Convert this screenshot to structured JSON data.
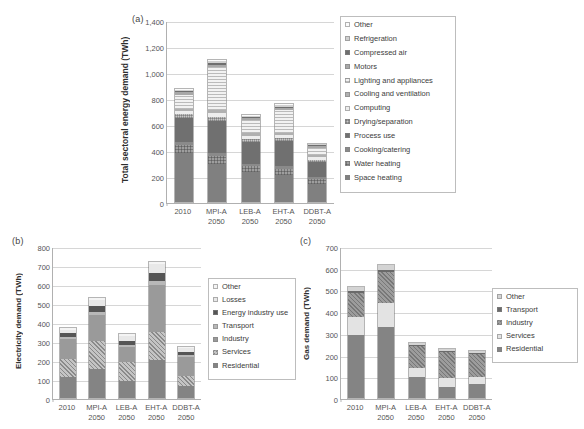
{
  "figure": {
    "background": "#ffffff",
    "categories": [
      "2010",
      "MPI-A\n2050",
      "LEB-A\n2050",
      "EHT-A\n2050",
      "DDBT-A\n2050"
    ]
  },
  "chart_data": [
    {
      "type": "bar",
      "stacked": true,
      "panel": "(a)",
      "title": "",
      "xlabel": "",
      "ylabel": "Total sectoral energy demand (TWh)",
      "ylim": [
        0,
        1400
      ],
      "ytick_step": 200,
      "yticks": [
        "0",
        "200",
        "400",
        "600",
        "800",
        "1,000",
        "1,200",
        "1,400"
      ],
      "grid": true,
      "legend_position": "right",
      "categories": [
        "2010",
        "MPI-A\n2050",
        "LEB-A\n2050",
        "EHT-A\n2050",
        "DDBT-A\n2050"
      ],
      "series": [
        {
          "name": "Space heating",
          "color": "#808080",
          "pattern": "solid",
          "values": [
            385,
            300,
            235,
            215,
            140
          ]
        },
        {
          "name": "Water heating",
          "color": "#9e9e9e",
          "pattern": "checker",
          "values": [
            60,
            60,
            45,
            45,
            40
          ]
        },
        {
          "name": "Cooking/catering",
          "color": "#8a8a8a",
          "pattern": "solid",
          "values": [
            25,
            25,
            20,
            20,
            20
          ]
        },
        {
          "name": "Process use",
          "color": "#707070",
          "pattern": "solid",
          "values": [
            190,
            250,
            175,
            200,
            120
          ]
        },
        {
          "name": "Drying/separation",
          "color": "#c8c8c8",
          "pattern": "dots",
          "values": [
            25,
            25,
            20,
            20,
            18
          ]
        },
        {
          "name": "Computing",
          "color": "#ededed",
          "pattern": "solid",
          "values": [
            25,
            35,
            25,
            25,
            20
          ]
        },
        {
          "name": "Cooling and ventilation",
          "color": "#b0b0b0",
          "pattern": "solid",
          "values": [
            20,
            25,
            20,
            20,
            15
          ]
        },
        {
          "name": "Lighting and appliances",
          "color": "#f2f2f2",
          "pattern": "hlines",
          "values": [
            110,
            330,
            105,
            175,
            60
          ]
        },
        {
          "name": "Motors",
          "color": "#a8a8a8",
          "pattern": "solid",
          "values": [
            18,
            20,
            15,
            18,
            12
          ]
        },
        {
          "name": "Compressed air",
          "color": "#6e6e6e",
          "pattern": "solid",
          "values": [
            10,
            12,
            8,
            10,
            7
          ]
        },
        {
          "name": "Refrigeration",
          "color": "#d0d0d0",
          "pattern": "solid",
          "values": [
            12,
            15,
            10,
            12,
            8
          ]
        },
        {
          "name": "Other",
          "color": "#fbfbfb",
          "pattern": "solid",
          "values": [
            8,
            10,
            7,
            8,
            5
          ]
        }
      ],
      "legend_entries": [
        "Other",
        "Refrigeration",
        "Compressed air",
        "Motors",
        "Lighting and appliances",
        "Cooling and ventilation",
        "Computing",
        "Drying/separation",
        "Process use",
        "Cooking/catering",
        "Water heating",
        "Space heating"
      ],
      "totals": [
        888,
        1107,
        678,
        778,
        465
      ]
    },
    {
      "type": "bar",
      "stacked": true,
      "panel": "(b)",
      "title": "",
      "xlabel": "",
      "ylabel": "Electricity demand (TWh)",
      "ylim": [
        0,
        800
      ],
      "ytick_step": 100,
      "yticks": [
        "0",
        "100",
        "200",
        "300",
        "400",
        "500",
        "600",
        "700",
        "800"
      ],
      "grid": true,
      "legend_position": "right",
      "categories": [
        "2010",
        "MPI-A\n2050",
        "LEB-A\n2050",
        "EHT-A\n2050",
        "DDBT-A\n2050"
      ],
      "series": [
        {
          "name": "Residential",
          "color": "#848484",
          "pattern": "solid",
          "values": [
            115,
            155,
            95,
            205,
            65
          ]
        },
        {
          "name": "Services",
          "color": "#c4c4c4",
          "pattern": "hatch",
          "values": [
            95,
            150,
            100,
            150,
            55
          ]
        },
        {
          "name": "Industry",
          "color": "#9a9a9a",
          "pattern": "solid",
          "values": [
            110,
            140,
            80,
            250,
            105
          ]
        },
        {
          "name": "Transport",
          "color": "#b8b8b8",
          "pattern": "solid",
          "values": [
            10,
            15,
            12,
            20,
            10
          ]
        },
        {
          "name": "Energy industry use",
          "color": "#555555",
          "pattern": "solid",
          "values": [
            20,
            35,
            25,
            45,
            18
          ]
        },
        {
          "name": "Losses",
          "color": "#e8e8e8",
          "pattern": "solid",
          "values": [
            20,
            30,
            25,
            45,
            20
          ]
        },
        {
          "name": "Other",
          "color": "#f4f4f4",
          "pattern": "solid",
          "values": [
            8,
            10,
            8,
            12,
            8
          ]
        }
      ],
      "legend_entries": [
        "Other",
        "Losses",
        "Energy industry use",
        "Transport",
        "Industry",
        "Services",
        "Residential"
      ],
      "totals": [
        378,
        535,
        345,
        727,
        281
      ]
    },
    {
      "type": "bar",
      "stacked": true,
      "panel": "(c)",
      "title": "",
      "xlabel": "",
      "ylabel": "Gas demand (TWh)",
      "ylim": [
        0,
        700
      ],
      "ytick_step": 100,
      "yticks": [
        "0",
        "100",
        "200",
        "300",
        "400",
        "500",
        "600",
        "700"
      ],
      "grid": true,
      "legend_position": "right",
      "categories": [
        "2010",
        "MPI-A\n2050",
        "LEB-A\n2050",
        "EHT-A\n2050",
        "DDBT-A\n2050"
      ],
      "series": [
        {
          "name": "Residential",
          "color": "#848484",
          "pattern": "solid",
          "values": [
            297,
            333,
            100,
            55,
            68
          ]
        },
        {
          "name": "Services",
          "color": "#e3e3e3",
          "pattern": "solid",
          "values": [
            85,
            113,
            42,
            40,
            32
          ]
        },
        {
          "name": "Industry",
          "color": "#9c9c9c",
          "pattern": "hatch",
          "values": [
            112,
            143,
            108,
            125,
            112
          ]
        },
        {
          "name": "Transport",
          "color": "#6a6a6a",
          "pattern": "solid",
          "values": [
            8,
            10,
            5,
            5,
            5
          ]
        },
        {
          "name": "Other",
          "color": "#d4d4d4",
          "pattern": "solid",
          "values": [
            20,
            22,
            8,
            8,
            8
          ]
        }
      ],
      "legend_entries": [
        "Other",
        "Transport",
        "Industry",
        "Services",
        "Residential"
      ],
      "totals": [
        522,
        621,
        263,
        233,
        225
      ]
    }
  ]
}
